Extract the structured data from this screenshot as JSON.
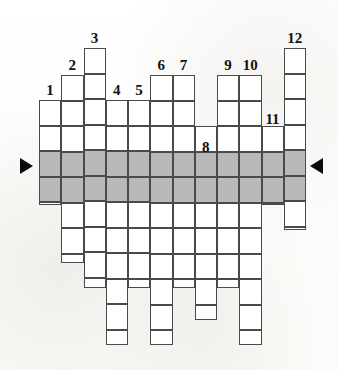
{
  "puzzle": {
    "type": "crossword-column-grid",
    "description": "Vertical-column crossword puzzle grid with a highlighted horizontal solution row marked by arrows on both sides.",
    "columns_total": 12,
    "cell_width": 22.25,
    "cell_height": 25.5,
    "grid_left": 39,
    "grid_right": 306,
    "solution_row_index": 6,
    "solution_row_top": 153,
    "solution_row_height": 26,
    "colors": {
      "cell_fill": "#ffffff",
      "cell_border": "#4a4a4a",
      "solution_row_fill": "#b9b9b9",
      "arrow_fill": "#0c0c0c",
      "number_color": "#111111",
      "page_background": "#fdfdfc"
    },
    "columns": [
      {
        "number": "1",
        "x": 39.0,
        "top": 100,
        "bottom": 205,
        "cells": 4,
        "label_x": 39.0,
        "label_y": 83
      },
      {
        "number": "2",
        "x": 61.3,
        "top": 75,
        "bottom": 263,
        "cells": 7,
        "label_x": 61.3,
        "label_y": 58
      },
      {
        "number": "3",
        "x": 83.5,
        "top": 48,
        "bottom": 288,
        "cells": 9,
        "label_x": 83.5,
        "label_y": 31
      },
      {
        "number": "4",
        "x": 105.8,
        "top": 100,
        "bottom": 345,
        "cells": 9,
        "label_x": 105.8,
        "label_y": 83
      },
      {
        "number": "5",
        "x": 128.0,
        "top": 100,
        "bottom": 288,
        "cells": 7,
        "label_x": 128.0,
        "label_y": 83
      },
      {
        "number": "6",
        "x": 150.3,
        "top": 75,
        "bottom": 345,
        "cells": 10,
        "label_x": 150.3,
        "label_y": 58
      },
      {
        "number": "7",
        "x": 172.5,
        "top": 75,
        "bottom": 288,
        "cells": 8,
        "label_x": 172.5,
        "label_y": 58
      },
      {
        "number": "8",
        "x": 194.8,
        "top": 126,
        "bottom": 320,
        "cells": 7,
        "label_x": 194.8,
        "label_y": 140
      },
      {
        "number": "9",
        "x": 217.0,
        "top": 75,
        "bottom": 288,
        "cells": 8,
        "label_x": 217.0,
        "label_y": 58
      },
      {
        "number": "10",
        "x": 239.3,
        "top": 75,
        "bottom": 345,
        "cells": 10,
        "label_x": 239.3,
        "label_y": 58
      },
      {
        "number": "11",
        "x": 261.5,
        "top": 126,
        "bottom": 205,
        "cells": 3,
        "label_x": 261.5,
        "label_y": 112
      },
      {
        "number": "12",
        "x": 283.8,
        "top": 48,
        "bottom": 230,
        "cells": 7,
        "label_x": 283.8,
        "label_y": 31
      }
    ],
    "arrows": [
      {
        "name": "solution-arrow-left",
        "direction": "right-pointing",
        "x": 20,
        "y": 158
      },
      {
        "name": "solution-arrow-right",
        "direction": "left-pointing",
        "x": 310,
        "y": 158
      }
    ]
  }
}
